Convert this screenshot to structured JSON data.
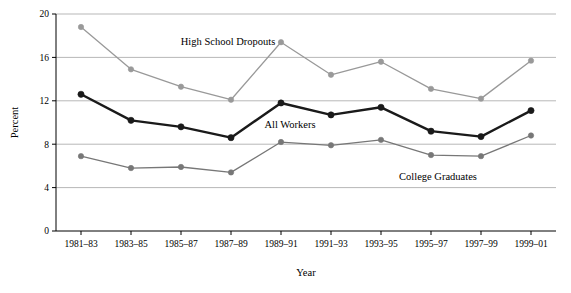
{
  "chart_data": {
    "type": "line",
    "title": "",
    "xlabel": "Year",
    "ylabel": "Percent",
    "categories": [
      "1981–83",
      "1983–85",
      "1985–87",
      "1987–89",
      "1989–91",
      "1991–93",
      "1993–95",
      "1995–97",
      "1997–99",
      "1999–01"
    ],
    "ylim": [
      0,
      20
    ],
    "yticks": [
      0,
      4,
      8,
      12,
      16,
      20
    ],
    "ytick_labels": [
      "0",
      "4",
      "8",
      "12",
      "16",
      "20"
    ],
    "grid": "horizontal",
    "legend": "inline-labels",
    "series": [
      {
        "name": "High School Dropouts",
        "color": "#999999",
        "label": "High School Dropouts",
        "values": [
          18.8,
          14.9,
          13.3,
          12.1,
          17.4,
          14.4,
          15.6,
          13.1,
          12.2,
          15.7
        ]
      },
      {
        "name": "All Workers",
        "color": "#1a1a1a",
        "label": "All Workers",
        "values": [
          12.6,
          10.2,
          9.6,
          8.6,
          11.8,
          10.7,
          11.4,
          9.2,
          8.7,
          11.1
        ]
      },
      {
        "name": "College Graduates",
        "color": "#777777",
        "label": "College Graduates",
        "values": [
          6.9,
          5.8,
          5.9,
          5.4,
          8.2,
          7.9,
          8.4,
          7.0,
          6.9,
          8.8
        ]
      }
    ]
  }
}
